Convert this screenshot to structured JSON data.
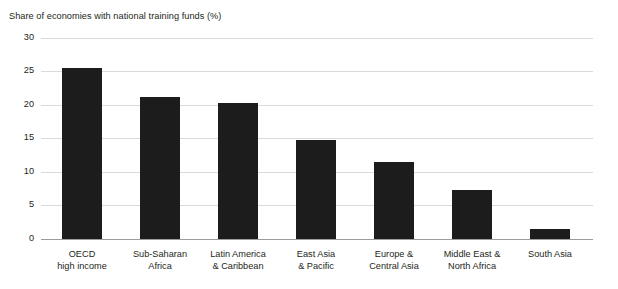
{
  "chart_data": {
    "type": "bar",
    "title": "Share of economies with national training funds (%)",
    "xlabel": "",
    "ylabel": "",
    "ylim": [
      0,
      30
    ],
    "yticks": [
      0,
      5,
      10,
      15,
      20,
      25,
      30
    ],
    "ytick_labels": [
      "0",
      "5",
      "10",
      "15",
      "20",
      "25",
      "30"
    ],
    "grid": "horizontal",
    "legend": "none",
    "bar_color": "#1c1c1c",
    "categories": [
      "OECD\nhigh income",
      "Sub-Saharan\nAfrica",
      "Latin America\n& Caribbean",
      "East Asia\n& Pacific",
      "Europe &\nCentral Asia",
      "Middle East &\nNorth Africa",
      "South Asia"
    ],
    "category_lines": [
      [
        "OECD",
        "high income"
      ],
      [
        "Sub-Saharan",
        "Africa"
      ],
      [
        "Latin America",
        "& Caribbean"
      ],
      [
        "East Asia",
        "& Pacific"
      ],
      [
        "Europe &",
        "Central Asia"
      ],
      [
        "Middle East &",
        "North Africa"
      ],
      [
        "South Asia",
        ""
      ]
    ],
    "values": [
      25.4,
      21.2,
      20.3,
      14.8,
      11.4,
      7.3,
      1.5
    ]
  }
}
